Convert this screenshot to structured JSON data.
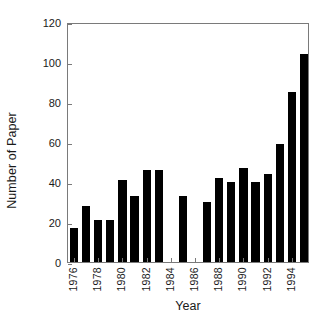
{
  "chart_data": {
    "type": "bar",
    "title": "",
    "xlabel": "Year",
    "ylabel": "Number of Paper",
    "categories": [
      1976,
      1977,
      1978,
      1979,
      1980,
      1981,
      1982,
      1983,
      1984,
      1985,
      1986,
      1987,
      1988,
      1989,
      1990,
      1991,
      1992,
      1993,
      1994,
      1995
    ],
    "values": [
      17,
      28,
      21,
      21,
      41,
      33,
      46,
      46,
      0,
      33,
      0,
      30,
      42,
      40,
      47,
      40,
      44,
      59,
      85,
      104
    ],
    "ylim": [
      0,
      120
    ],
    "yticks": [
      0,
      20,
      40,
      60,
      80,
      100,
      120
    ],
    "xticks": [
      1976,
      1978,
      1980,
      1982,
      1984,
      1986,
      1988,
      1990,
      1992,
      1994
    ],
    "xtick_labels": [
      "1976",
      "1978",
      "1980",
      "1982",
      "1984",
      "1986",
      "1988",
      "1990",
      "1992",
      "1994"
    ],
    "ytick_labels": [
      "0",
      "20",
      "40",
      "60",
      "80",
      "100",
      "120"
    ],
    "grid": false,
    "legend": null,
    "bar_color": "#000000",
    "axis_color": "#7a7a7a",
    "text_color": "#1a1a1a"
  }
}
